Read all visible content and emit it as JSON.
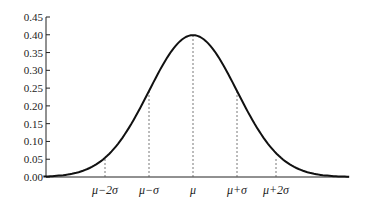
{
  "chart_data": {
    "type": "line",
    "title": "",
    "xlabel": "",
    "ylabel": "",
    "ylim": [
      0,
      0.45
    ],
    "y_ticks": [
      "0.00",
      "0.05",
      "0.10",
      "0.15",
      "0.20",
      "0.25",
      "0.30",
      "0.35",
      "0.40",
      "0.45"
    ],
    "x_ticks": [
      "μ−2σ",
      "μ−σ",
      "μ",
      "μ+σ",
      "μ+2σ"
    ],
    "grid": false,
    "legend": null,
    "series": [
      {
        "name": "normal density",
        "x_sigma": [
          -3.4,
          -3,
          -2.5,
          -2,
          -1.5,
          -1,
          -0.5,
          0,
          0.5,
          1,
          1.5,
          2,
          2.5,
          3,
          3.4
        ],
        "values": [
          0.001,
          0.004,
          0.018,
          0.054,
          0.13,
          0.242,
          0.352,
          0.399,
          0.352,
          0.242,
          0.13,
          0.054,
          0.018,
          0.004,
          0.001
        ]
      }
    ],
    "annotations": [
      {
        "type": "dashed-vline",
        "at": "μ−2σ",
        "height": 0.054
      },
      {
        "type": "dashed-vline",
        "at": "μ−σ",
        "height": 0.242
      },
      {
        "type": "dashed-vline",
        "at": "μ",
        "height": 0.399
      },
      {
        "type": "dashed-vline",
        "at": "μ+σ",
        "height": 0.242
      },
      {
        "type": "dashed-vline",
        "at": "μ+2σ",
        "height": 0.054
      }
    ]
  }
}
